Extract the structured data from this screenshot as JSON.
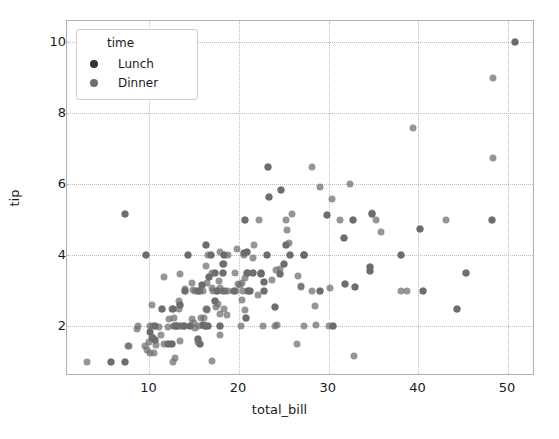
{
  "chart_data": {
    "type": "scatter",
    "title": "",
    "xlabel": "total_bill",
    "ylabel": "tip",
    "xlim": [
      0.8,
      53.0
    ],
    "ylim": [
      0.6,
      10.6
    ],
    "xticks": [
      "10",
      "20",
      "30",
      "40",
      "50"
    ],
    "xtick_values": [
      10,
      20,
      30,
      40,
      50
    ],
    "yticks": [
      "2",
      "4",
      "6",
      "8",
      "10"
    ],
    "ytick_values": [
      2,
      4,
      6,
      8,
      10
    ],
    "grid": true,
    "grid_style": "dotted",
    "legend": {
      "title": "time",
      "position": "upper-left",
      "entries": [
        {
          "label": "Lunch",
          "color": "#333333"
        },
        {
          "label": "Dinner",
          "color": "#6e6e6e"
        }
      ]
    },
    "marker": {
      "size": 7,
      "opacity": 0.72
    },
    "series": [
      {
        "name": "Lunch",
        "color": "#333333",
        "points": [
          [
            27.2,
            4.0
          ],
          [
            22.76,
            3.0
          ],
          [
            17.29,
            2.71
          ],
          [
            19.44,
            3.0
          ],
          [
            16.66,
            3.4
          ],
          [
            10.07,
            1.83
          ],
          [
            32.68,
            5.0
          ],
          [
            15.98,
            2.03
          ],
          [
            34.83,
            5.17
          ],
          [
            13.03,
            2.0
          ],
          [
            18.28,
            4.0
          ],
          [
            24.71,
            5.85
          ],
          [
            21.16,
            3.0
          ],
          [
            28.97,
            3.0
          ],
          [
            22.49,
            3.5
          ],
          [
            5.75,
            1.0
          ],
          [
            16.32,
            4.3
          ],
          [
            22.75,
            3.25
          ],
          [
            40.17,
            4.73
          ],
          [
            27.28,
            4.0
          ],
          [
            12.03,
            1.5
          ],
          [
            21.01,
            3.0
          ],
          [
            12.46,
            1.5
          ],
          [
            11.35,
            2.5
          ],
          [
            15.38,
            3.0
          ],
          [
            44.3,
            2.5
          ],
          [
            22.42,
            3.48
          ],
          [
            20.92,
            4.08
          ],
          [
            15.36,
            1.64
          ],
          [
            20.49,
            4.06
          ],
          [
            25.21,
            4.29
          ],
          [
            18.24,
            3.76
          ],
          [
            14.31,
            4.0
          ],
          [
            14.0,
            3.0
          ],
          [
            7.25,
            1.0
          ],
          [
            38.07,
            4.0
          ],
          [
            23.95,
            2.55
          ],
          [
            25.71,
            4.0
          ],
          [
            17.31,
            3.5
          ],
          [
            29.85,
            5.14
          ],
          [
            48.17,
            5.0
          ],
          [
            25.0,
            3.75
          ],
          [
            13.39,
            2.61
          ],
          [
            16.49,
            2.0
          ],
          [
            21.5,
            3.5
          ],
          [
            12.66,
            2.5
          ],
          [
            16.21,
            2.0
          ],
          [
            13.81,
            2.0
          ],
          [
            17.51,
            3.0
          ],
          [
            24.52,
            3.48
          ],
          [
            20.76,
            2.24
          ],
          [
            31.71,
            4.5
          ],
          [
            10.59,
            1.61
          ],
          [
            10.63,
            2.0
          ],
          [
            50.81,
            10.0
          ],
          [
            15.81,
            3.16
          ],
          [
            7.25,
            5.15
          ],
          [
            31.85,
            3.18
          ],
          [
            16.82,
            4.0
          ],
          [
            32.9,
            3.11
          ],
          [
            17.89,
            2.0
          ],
          [
            14.48,
            2.0
          ],
          [
            9.6,
            4.0
          ],
          [
            34.63,
            3.55
          ],
          [
            34.65,
            3.68
          ],
          [
            23.33,
            5.65
          ],
          [
            45.35,
            3.5
          ],
          [
            23.17,
            6.5
          ],
          [
            40.55,
            3.0
          ],
          [
            20.69,
            5.0
          ],
          [
            20.9,
            3.5
          ],
          [
            30.46,
            2.0
          ],
          [
            18.15,
            3.5
          ],
          [
            23.1,
            4.0
          ],
          [
            15.69,
            1.5
          ]
        ]
      },
      {
        "name": "Dinner",
        "color": "#6e6e6e",
        "points": [
          [
            16.99,
            1.01
          ],
          [
            10.34,
            1.66
          ],
          [
            21.01,
            3.5
          ],
          [
            23.68,
            3.31
          ],
          [
            24.59,
            3.61
          ],
          [
            25.29,
            4.71
          ],
          [
            8.77,
            2.0
          ],
          [
            26.88,
            3.12
          ],
          [
            15.04,
            1.96
          ],
          [
            14.78,
            3.23
          ],
          [
            10.27,
            1.71
          ],
          [
            35.26,
            5.0
          ],
          [
            15.42,
            1.57
          ],
          [
            18.43,
            3.0
          ],
          [
            14.83,
            3.02
          ],
          [
            21.58,
            3.92
          ],
          [
            10.33,
            1.67
          ],
          [
            16.29,
            3.71
          ],
          [
            16.97,
            3.5
          ],
          [
            20.65,
            3.35
          ],
          [
            17.92,
            4.08
          ],
          [
            20.29,
            2.75
          ],
          [
            15.77,
            2.23
          ],
          [
            39.42,
            7.58
          ],
          [
            19.82,
            3.18
          ],
          [
            17.81,
            2.34
          ],
          [
            13.37,
            2.0
          ],
          [
            12.69,
            2.0
          ],
          [
            21.7,
            4.3
          ],
          [
            19.65,
            3.0
          ],
          [
            9.55,
            1.45
          ],
          [
            18.35,
            2.5
          ],
          [
            15.06,
            3.0
          ],
          [
            20.69,
            2.45
          ],
          [
            17.78,
            3.27
          ],
          [
            24.06,
            3.6
          ],
          [
            16.31,
            2.0
          ],
          [
            16.93,
            3.07
          ],
          [
            18.69,
            2.31
          ],
          [
            31.27,
            5.0
          ],
          [
            16.04,
            2.24
          ],
          [
            17.46,
            2.54
          ],
          [
            13.94,
            3.06
          ],
          [
            9.68,
            1.32
          ],
          [
            30.4,
            5.6
          ],
          [
            18.29,
            3.0
          ],
          [
            22.23,
            5.0
          ],
          [
            32.4,
            6.0
          ],
          [
            28.55,
            2.05
          ],
          [
            18.04,
            3.0
          ],
          [
            12.54,
            2.5
          ],
          [
            10.29,
            2.6
          ],
          [
            34.81,
            5.2
          ],
          [
            9.94,
            1.56
          ],
          [
            25.56,
            4.34
          ],
          [
            19.49,
            3.51
          ],
          [
            38.01,
            3.0
          ],
          [
            26.41,
            1.5
          ],
          [
            11.24,
            1.76
          ],
          [
            48.27,
            6.73
          ],
          [
            20.29,
            3.21
          ],
          [
            13.81,
            2.0
          ],
          [
            11.02,
            1.98
          ],
          [
            18.29,
            3.76
          ],
          [
            17.59,
            2.64
          ],
          [
            20.08,
            3.15
          ],
          [
            16.45,
            2.47
          ],
          [
            3.07,
            1.0
          ],
          [
            20.23,
            2.01
          ],
          [
            15.01,
            2.09
          ],
          [
            12.02,
            1.97
          ],
          [
            17.07,
            3.0
          ],
          [
            26.86,
            3.14
          ],
          [
            25.28,
            5.0
          ],
          [
            14.73,
            2.2
          ],
          [
            10.51,
            1.25
          ],
          [
            17.92,
            3.08
          ],
          [
            27.2,
            4.0
          ],
          [
            22.76,
            3.0
          ],
          [
            17.29,
            2.71
          ],
          [
            19.44,
            3.0
          ],
          [
            16.66,
            3.4
          ],
          [
            32.68,
            5.0
          ],
          [
            15.98,
            2.03
          ],
          [
            34.83,
            5.17
          ],
          [
            13.03,
            2.0
          ],
          [
            18.28,
            4.0
          ],
          [
            24.71,
            5.85
          ],
          [
            21.16,
            3.0
          ],
          [
            28.97,
            3.0
          ],
          [
            22.49,
            3.5
          ],
          [
            5.75,
            1.0
          ],
          [
            16.32,
            4.3
          ],
          [
            22.75,
            3.25
          ],
          [
            40.17,
            4.73
          ],
          [
            27.28,
            4.0
          ],
          [
            12.03,
            1.5
          ],
          [
            21.01,
            3.0
          ],
          [
            12.46,
            1.5
          ],
          [
            11.35,
            2.5
          ],
          [
            15.38,
            3.0
          ],
          [
            44.3,
            2.5
          ],
          [
            22.42,
            3.48
          ],
          [
            20.92,
            4.08
          ],
          [
            15.36,
            1.64
          ],
          [
            20.49,
            4.06
          ],
          [
            25.21,
            4.29
          ],
          [
            18.24,
            3.76
          ],
          [
            14.31,
            4.0
          ],
          [
            14.0,
            3.0
          ],
          [
            7.25,
            1.0
          ],
          [
            38.07,
            4.0
          ],
          [
            23.95,
            2.55
          ],
          [
            25.71,
            4.0
          ],
          [
            17.31,
            3.5
          ],
          [
            29.85,
            5.14
          ],
          [
            48.17,
            5.0
          ],
          [
            25.0,
            3.75
          ],
          [
            13.39,
            2.61
          ],
          [
            16.49,
            2.0
          ],
          [
            21.5,
            3.5
          ],
          [
            12.66,
            2.5
          ],
          [
            16.21,
            2.0
          ],
          [
            13.81,
            2.0
          ],
          [
            17.51,
            3.0
          ],
          [
            24.52,
            3.48
          ],
          [
            20.76,
            2.24
          ],
          [
            31.71,
            4.5
          ],
          [
            10.59,
            1.61
          ],
          [
            10.63,
            2.0
          ],
          [
            50.81,
            10.0
          ],
          [
            15.81,
            3.16
          ],
          [
            7.25,
            5.15
          ],
          [
            31.85,
            3.18
          ],
          [
            16.82,
            4.0
          ],
          [
            32.9,
            3.11
          ],
          [
            17.89,
            2.0
          ],
          [
            14.48,
            2.0
          ],
          [
            9.6,
            4.0
          ],
          [
            34.63,
            3.55
          ],
          [
            34.65,
            3.68
          ],
          [
            23.33,
            5.65
          ],
          [
            45.35,
            3.5
          ],
          [
            23.17,
            6.5
          ],
          [
            40.55,
            3.0
          ],
          [
            20.69,
            5.0
          ],
          [
            20.9,
            3.5
          ],
          [
            30.46,
            2.0
          ],
          [
            18.15,
            3.5
          ],
          [
            23.1,
            4.0
          ],
          [
            15.69,
            1.5
          ],
          [
            19.81,
            4.19
          ],
          [
            28.44,
            2.56
          ],
          [
            15.48,
            2.02
          ],
          [
            16.58,
            4.0
          ],
          [
            7.56,
            1.44
          ],
          [
            10.34,
            2.0
          ],
          [
            43.11,
            5.0
          ],
          [
            13.0,
            2.0
          ],
          [
            13.51,
            2.0
          ],
          [
            18.71,
            4.0
          ],
          [
            12.74,
            2.01
          ],
          [
            13.0,
            2.0
          ],
          [
            16.4,
            2.5
          ],
          [
            20.53,
            4.0
          ],
          [
            16.47,
            3.23
          ],
          [
            26.59,
            3.41
          ],
          [
            38.73,
            3.0
          ],
          [
            24.27,
            2.03
          ],
          [
            12.76,
            2.23
          ],
          [
            30.06,
            2.0
          ],
          [
            25.89,
            5.16
          ],
          [
            48.33,
            9.0
          ],
          [
            13.27,
            2.5
          ],
          [
            28.17,
            6.5
          ],
          [
            12.9,
            1.1
          ],
          [
            28.15,
            3.0
          ],
          [
            11.59,
            1.5
          ],
          [
            7.74,
            1.44
          ],
          [
            30.14,
            3.09
          ],
          [
            12.16,
            2.2
          ],
          [
            13.42,
            3.48
          ],
          [
            8.58,
            1.92
          ],
          [
            15.98,
            3.0
          ],
          [
            13.42,
            1.58
          ],
          [
            16.27,
            2.5
          ],
          [
            10.09,
            2.0
          ],
          [
            20.45,
            3.0
          ],
          [
            13.28,
            2.72
          ],
          [
            22.12,
            2.88
          ],
          [
            24.01,
            2.0
          ],
          [
            15.69,
            3.0
          ],
          [
            11.61,
            3.39
          ],
          [
            10.77,
            1.47
          ],
          [
            15.53,
            3.0
          ],
          [
            10.07,
            1.25
          ],
          [
            12.6,
            1.0
          ],
          [
            32.83,
            1.17
          ],
          [
            35.83,
            4.67
          ],
          [
            29.03,
            5.92
          ],
          [
            27.18,
            2.0
          ],
          [
            22.67,
            2.0
          ],
          [
            17.82,
            1.75
          ],
          [
            18.78,
            3.0
          ]
        ]
      }
    ]
  },
  "axes": {
    "xlabel": "total_bill",
    "ylabel": "tip"
  },
  "legend": {
    "title": "time",
    "entries": [
      {
        "label": "Lunch"
      },
      {
        "label": "Dinner"
      }
    ]
  }
}
